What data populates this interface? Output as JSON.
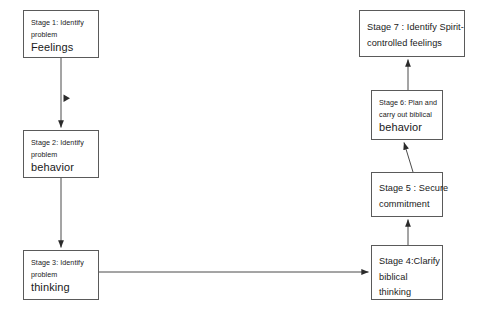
{
  "diagram": {
    "background_color": "#ffffff",
    "line_color": "#4a4a4a",
    "text_color": "#1a1a1a",
    "nodes": [
      {
        "id": "stage1",
        "label_small": "Stage 1: Identify",
        "label_small2": "problem",
        "label_large": "Feelings",
        "x": 23,
        "y": 10,
        "w": 76,
        "h": 48
      },
      {
        "id": "stage2",
        "label_small": "Stage 2: Identify",
        "label_small2": "problem",
        "label_large": "behavior",
        "x": 23,
        "y": 130,
        "w": 76,
        "h": 48
      },
      {
        "id": "stage3",
        "label_small": "Stage 3: Identify",
        "label_small2": "problem",
        "label_large": "thinking",
        "x": 23,
        "y": 250,
        "w": 76,
        "h": 50
      },
      {
        "id": "stage4",
        "line1": "Stage 4:Clarify",
        "line2": "biblical",
        "line3": "thinking",
        "x": 371,
        "y": 245,
        "w": 72,
        "h": 55
      },
      {
        "id": "stage5",
        "line1": "Stage 5 : Secure",
        "line2": "commitment",
        "x": 371,
        "y": 172,
        "w": 72,
        "h": 45
      },
      {
        "id": "stage6",
        "label_small": "Stage 6: Plan and",
        "label_small2": "carry out biblical",
        "label_large": "behavior",
        "x": 371,
        "y": 90,
        "w": 72,
        "h": 50
      },
      {
        "id": "stage7",
        "line1": "Stage 7 : Identify Spirit-",
        "line2": "controlled feelings",
        "x": 359,
        "y": 10,
        "w": 106,
        "h": 47
      }
    ],
    "edges": [
      {
        "id": "edge-1-to-2",
        "from": "stage1",
        "to": "stage2",
        "direction": "down"
      },
      {
        "id": "edge-2-to-3",
        "from": "stage2",
        "to": "stage3",
        "direction": "down"
      },
      {
        "id": "edge-3-to-4",
        "from": "stage3",
        "to": "stage4",
        "direction": "right"
      },
      {
        "id": "edge-4-to-5",
        "from": "stage4",
        "to": "stage5",
        "direction": "up"
      },
      {
        "id": "edge-5-to-6",
        "from": "stage5",
        "to": "stage6",
        "direction": "up"
      },
      {
        "id": "edge-6-to-7",
        "from": "stage6",
        "to": "stage7",
        "direction": "up"
      }
    ]
  }
}
